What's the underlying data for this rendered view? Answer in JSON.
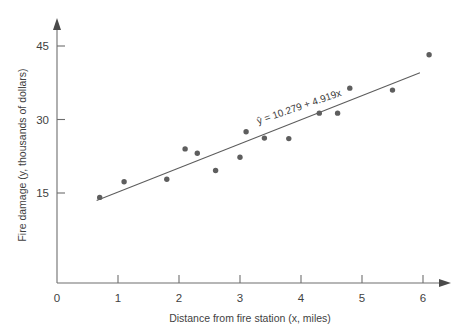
{
  "figure": {
    "background_color": "#ffffff",
    "point_color": "#5e5e5e",
    "line_color": "#5c5c5c",
    "axis_color": "#6e6e6e"
  },
  "chart_data": {
    "type": "scatter",
    "title": "",
    "xlabel": "Distance from fire station (x, miles)",
    "ylabel": "Fire damage (y, thousands of dollars)",
    "xlim": [
      0,
      6.35
    ],
    "ylim": [
      0,
      47
    ],
    "xticks": [
      0,
      1,
      2,
      3,
      4,
      5,
      6
    ],
    "xtick_labels": [
      "0",
      "1",
      "2",
      "3",
      "4",
      "5",
      "6"
    ],
    "yticks": [
      15,
      30,
      45
    ],
    "ytick_labels": [
      "15",
      "30",
      "45"
    ],
    "grid": false,
    "legend": "none",
    "x": [
      0.7,
      1.1,
      1.8,
      2.1,
      2.3,
      2.6,
      3.0,
      3.1,
      3.4,
      3.8,
      4.3,
      4.6,
      4.8,
      5.5,
      6.1
    ],
    "y": [
      14.1,
      17.3,
      17.8,
      24.0,
      23.1,
      19.6,
      22.3,
      27.5,
      26.2,
      26.1,
      31.3,
      31.3,
      36.4,
      36.0,
      43.2
    ],
    "points": [
      {
        "x": 0.7,
        "y": 14.1
      },
      {
        "x": 1.1,
        "y": 17.3
      },
      {
        "x": 1.8,
        "y": 17.8
      },
      {
        "x": 2.1,
        "y": 24.0
      },
      {
        "x": 2.3,
        "y": 23.1
      },
      {
        "x": 2.6,
        "y": 19.6
      },
      {
        "x": 3.0,
        "y": 22.3
      },
      {
        "x": 3.1,
        "y": 27.5
      },
      {
        "x": 3.4,
        "y": 26.2
      },
      {
        "x": 3.8,
        "y": 26.1
      },
      {
        "x": 4.3,
        "y": 31.3
      },
      {
        "x": 4.6,
        "y": 31.3
      },
      {
        "x": 4.8,
        "y": 36.4
      },
      {
        "x": 5.5,
        "y": 36.0
      },
      {
        "x": 6.1,
        "y": 43.2
      }
    ],
    "annotations": [
      {
        "text": "ŷ = 10.279 + 4.919x",
        "x": 3.3,
        "y": 29.0,
        "rotation": -19
      }
    ],
    "fit": {
      "type": "linear",
      "intercept": 10.279,
      "slope": 4.919,
      "equation": "ŷ = 10.279 + 4.919x",
      "x_start": 0.65,
      "x_end": 5.95
    }
  }
}
